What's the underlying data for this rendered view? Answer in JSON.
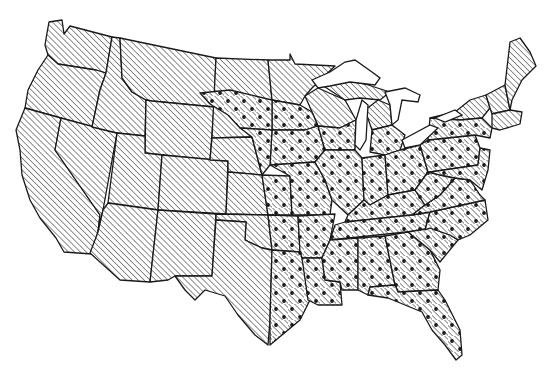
{
  "map": {
    "subject": "Contiguous United States",
    "style": "black-and-white line map with pattern fills",
    "colors": {
      "outline": "#1a1a1a",
      "hatch": "#333333",
      "dot": "#1a1a1a",
      "background": "#ffffff"
    },
    "legend_patterns": [
      {
        "pattern": "diagonal-hatch",
        "meaning": ""
      },
      {
        "pattern": "diagonal-hatch-with-dots",
        "meaning": ""
      }
    ],
    "hatched_region": [
      "Washington",
      "Oregon",
      "California",
      "Nevada",
      "Idaho",
      "Montana",
      "Wyoming",
      "Utah",
      "Arizona",
      "Colorado",
      "New Mexico",
      "North Dakota",
      "South Dakota",
      "Nebraska (west)",
      "Kansas (west)",
      "Oklahoma (west)",
      "Texas (west)",
      "Minnesota (north)",
      "Wisconsin (north)",
      "Michigan (north)",
      "New York (north)",
      "Vermont",
      "New Hampshire",
      "Maine",
      "Massachusetts",
      "Connecticut",
      "Rhode Island"
    ],
    "dotted_region": [
      "Minnesota (south)",
      "Iowa",
      "Missouri",
      "Nebraska (east)",
      "Kansas (east)",
      "Oklahoma (east)",
      "Texas (east)",
      "Arkansas",
      "Louisiana",
      "Wisconsin (south)",
      "Illinois",
      "Indiana",
      "Ohio",
      "Michigan (south)",
      "Kentucky",
      "Tennessee",
      "Mississippi",
      "Alabama",
      "Georgia",
      "Florida",
      "South Carolina",
      "North Carolina",
      "Virginia",
      "West Virginia",
      "Maryland",
      "Delaware",
      "Pennsylvania",
      "New Jersey",
      "New York (south)"
    ]
  }
}
